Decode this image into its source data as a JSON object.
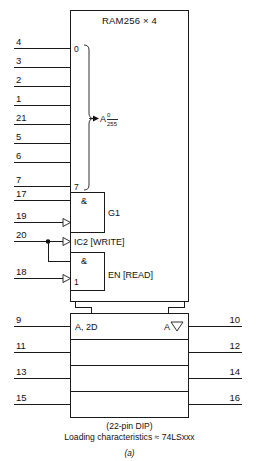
{
  "figure": {
    "title": "RAM256 × 4",
    "caption_line1": "(22-pin DIP)",
    "caption_line2": "Loading characteristics ≈ 74LSxxx",
    "figure_label": "(a)"
  },
  "address_section": {
    "top_index": "0",
    "bottom_index": "7",
    "group_label_letter": "A",
    "group_label_numerator": "0",
    "group_label_denominator": "255",
    "pins": [
      {
        "number": "4",
        "y": 48
      },
      {
        "number": "3",
        "y": 67
      },
      {
        "number": "2",
        "y": 86
      },
      {
        "number": "1",
        "y": 105
      },
      {
        "number": "21",
        "y": 124
      },
      {
        "number": "5",
        "y": 143
      },
      {
        "number": "6",
        "y": 162
      },
      {
        "number": "7",
        "y": 186
      }
    ]
  },
  "control_section": {
    "gate1_symbol": "&",
    "gate1_label": "G1",
    "write_label": "IC2 [WRITE]",
    "gate2_symbol": "&",
    "gate2_index": "1",
    "read_label": "EN [READ]",
    "pins": [
      {
        "number": "17",
        "y": 200
      },
      {
        "number": "19",
        "y": 222
      },
      {
        "number": "20",
        "y": 241
      },
      {
        "number": "18",
        "y": 278
      }
    ]
  },
  "data_section": {
    "input_label": "A, 2D",
    "output_label_letter": "A",
    "output_label_symbol": "▽",
    "input_pins": [
      {
        "number": "9",
        "y": 322
      },
      {
        "number": "11",
        "y": 351
      },
      {
        "number": "13",
        "y": 378
      },
      {
        "number": "15",
        "y": 404
      }
    ],
    "output_pins": [
      {
        "number": "10",
        "y": 322
      },
      {
        "number": "12",
        "y": 351
      },
      {
        "number": "14",
        "y": 378
      },
      {
        "number": "16",
        "y": 404
      }
    ]
  },
  "colors": {
    "line": "#1a1a1a",
    "text": "#111111",
    "background": "#ffffff"
  }
}
